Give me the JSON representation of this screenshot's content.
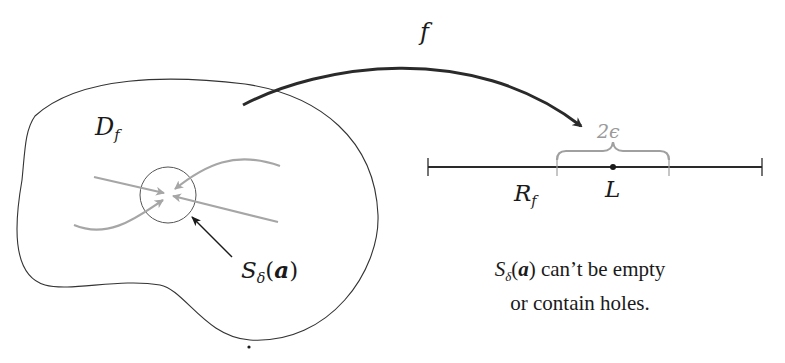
{
  "diagram": {
    "labels": {
      "function": "f",
      "domain_main": "D",
      "domain_sub": "f",
      "range_main": "R",
      "range_sub": "f",
      "limit": "L",
      "epsilon_width": "2ϵ",
      "neighborhood_main": "S",
      "neighborhood_sub": "δ",
      "neighborhood_open": "(",
      "neighborhood_arg": "a",
      "neighborhood_close": ")"
    },
    "caption": {
      "line1_prefix_main": "S",
      "line1_prefix_sub": "δ",
      "line1_prefix_open": "(",
      "line1_prefix_arg": "a",
      "line1_prefix_close": ")",
      "line1_rest": " can’t be empty",
      "line2": "or contain holes."
    },
    "colors": {
      "ink": "#1a1a1a",
      "path_gray": "#a6a6a6",
      "brace_gray": "#a0a0a0"
    }
  }
}
